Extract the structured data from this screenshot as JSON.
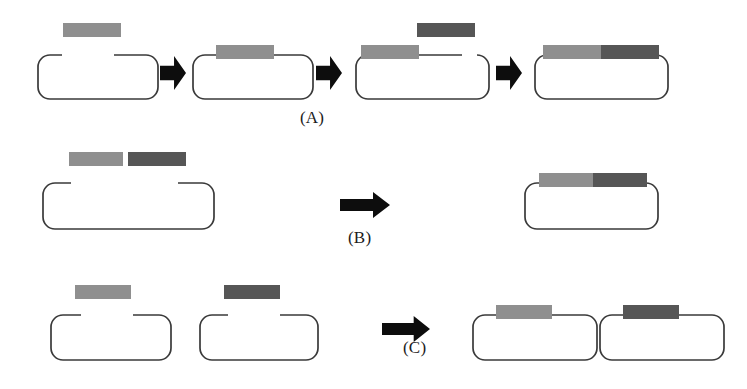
{
  "figure": {
    "background_color": "#ffffff",
    "width": 747,
    "height": 389
  },
  "colors": {
    "insert_light": "#8f8f8f",
    "insert_dark": "#565656",
    "backbone_stroke": "#3a3a3a",
    "arrow_fill": "#0d0d0d",
    "label_text": "#1c1c1c"
  },
  "labels": [
    {
      "id": "label-a",
      "text": "(A)",
      "x": 300,
      "y": 108
    },
    {
      "id": "label-b",
      "text": "(B)",
      "x": 348,
      "y": 228
    },
    {
      "id": "label-c",
      "text": "(C)",
      "x": 403,
      "y": 338
    }
  ],
  "rows": [
    {
      "id": "row-a",
      "label": "(A)",
      "description": "Sequential insertion: one fragment at a time is added to the linearized backbone",
      "steps": [
        {
          "id": "a-step-1",
          "name": "linear-backbone-with-free-light-insert",
          "plasmid": {
            "x": 35,
            "y": 52,
            "w": 120,
            "h": 44,
            "gap": {
              "start": 24,
              "end": 76
            }
          },
          "inserts": [
            {
              "id": "a1-insert-light",
              "shade": "insert_light",
              "x": 63,
              "y": 23,
              "w": 58,
              "h": 14,
              "attached": false
            }
          ]
        },
        {
          "id": "a-step-2",
          "name": "backbone-with-light-insert-ligated",
          "plasmid": {
            "x": 190,
            "y": 52,
            "w": 120,
            "h": 44,
            "gap": null
          },
          "inserts": [
            {
              "id": "a2-insert-light",
              "shade": "insert_light",
              "x": 216,
              "y": 45,
              "w": 58,
              "h": 14,
              "attached": true
            }
          ]
        },
        {
          "id": "a-step-3",
          "name": "backbone-light-insert-plus-free-dark-insert",
          "plasmid": {
            "x": 353,
            "y": 52,
            "w": 133,
            "h": 44,
            "gap": {
              "start": 106,
              "end": 126
            }
          },
          "inserts": [
            {
              "id": "a3-insert-light",
              "shade": "insert_light",
              "x": 361,
              "y": 45,
              "w": 58,
              "h": 14,
              "attached": true
            },
            {
              "id": "a3-insert-dark",
              "shade": "insert_dark",
              "x": 417,
              "y": 23,
              "w": 58,
              "h": 14,
              "attached": false
            }
          ]
        },
        {
          "id": "a-step-4",
          "name": "completed-construct-two-inserts",
          "plasmid": {
            "x": 532,
            "y": 52,
            "w": 133,
            "h": 44,
            "gap": null
          },
          "inserts": [
            {
              "id": "a4-insert-light",
              "shade": "insert_light",
              "x": 543,
              "y": 45,
              "w": 58,
              "h": 14,
              "attached": true
            },
            {
              "id": "a4-insert-dark",
              "shade": "insert_dark",
              "x": 601,
              "y": 45,
              "w": 58,
              "h": 14,
              "attached": true
            }
          ]
        }
      ],
      "arrows": [
        {
          "id": "a-arrow-1",
          "style": "stubby",
          "x": 160,
          "y": 56,
          "w": 26,
          "h": 34
        },
        {
          "id": "a-arrow-2",
          "style": "stubby",
          "x": 316,
          "y": 56,
          "w": 26,
          "h": 34
        },
        {
          "id": "a-arrow-3",
          "style": "stubby",
          "x": 496,
          "y": 56,
          "w": 26,
          "h": 34
        }
      ]
    },
    {
      "id": "row-b",
      "label": "(B)",
      "description": "Simultaneous insertion: both fragments are ligated into one backbone in a single step",
      "steps": [
        {
          "id": "b-step-1",
          "name": "linear-backbone-with-two-free-inserts",
          "plasmid": {
            "x": 40,
            "y": 180,
            "w": 171,
            "h": 46,
            "gap": {
              "start": 28,
              "end": 135
            }
          },
          "inserts": [
            {
              "id": "b1-insert-light",
              "shade": "insert_light",
              "x": 69,
              "y": 152,
              "w": 54,
              "h": 14,
              "attached": false
            },
            {
              "id": "b1-insert-dark",
              "shade": "insert_dark",
              "x": 128,
              "y": 152,
              "w": 58,
              "h": 14,
              "attached": false
            }
          ]
        },
        {
          "id": "b-step-2",
          "name": "completed-construct-two-inserts",
          "plasmid": {
            "x": 522,
            "y": 180,
            "w": 133,
            "h": 46,
            "gap": null
          },
          "inserts": [
            {
              "id": "b2-insert-light",
              "shade": "insert_light",
              "x": 539,
              "y": 173,
              "w": 54,
              "h": 14,
              "attached": true
            },
            {
              "id": "b2-insert-dark",
              "shade": "insert_dark",
              "x": 593,
              "y": 173,
              "w": 54,
              "h": 14,
              "attached": true
            }
          ]
        }
      ],
      "arrows": [
        {
          "id": "b-arrow-1",
          "style": "long",
          "x": 340,
          "y": 192,
          "w": 50,
          "h": 26
        }
      ]
    },
    {
      "id": "row-c",
      "label": "(C)",
      "description": "Parallel insertion: each fragment is cloned into its own separate backbone",
      "steps": [
        {
          "id": "c-step-1",
          "name": "first-linear-backbone-with-light-insert",
          "plasmid": {
            "x": 48,
            "y": 312,
            "w": 120,
            "h": 45,
            "gap": {
              "start": 30,
              "end": 82
            }
          },
          "inserts": [
            {
              "id": "c1-insert-light",
              "shade": "insert_light",
              "x": 75,
              "y": 285,
              "w": 56,
              "h": 14,
              "attached": false
            }
          ]
        },
        {
          "id": "c-step-2",
          "name": "second-linear-backbone-with-dark-insert",
          "plasmid": {
            "x": 197,
            "y": 312,
            "w": 118,
            "h": 45,
            "gap": {
              "start": 28,
              "end": 80
            }
          },
          "inserts": [
            {
              "id": "c2-insert-dark",
              "shade": "insert_dark",
              "x": 224,
              "y": 285,
              "w": 56,
              "h": 14,
              "attached": false
            }
          ]
        },
        {
          "id": "c-step-3",
          "name": "first-completed-construct",
          "plasmid": {
            "x": 470,
            "y": 312,
            "w": 124,
            "h": 45,
            "gap": null
          },
          "inserts": [
            {
              "id": "c3-insert-light",
              "shade": "insert_light",
              "x": 496,
              "y": 305,
              "w": 56,
              "h": 14,
              "attached": true
            }
          ]
        },
        {
          "id": "c-step-4",
          "name": "second-completed-construct",
          "plasmid": {
            "x": 597,
            "y": 312,
            "w": 124,
            "h": 45,
            "gap": null
          },
          "inserts": [
            {
              "id": "c4-insert-dark",
              "shade": "insert_dark",
              "x": 623,
              "y": 305,
              "w": 56,
              "h": 14,
              "attached": true
            }
          ]
        }
      ],
      "arrows": [
        {
          "id": "c-arrow-1",
          "style": "long",
          "x": 382,
          "y": 316,
          "w": 48,
          "h": 26
        }
      ]
    }
  ]
}
